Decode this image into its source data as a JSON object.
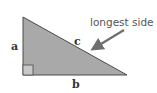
{
  "diagram": {
    "type": "right-triangle",
    "labels": {
      "side_a": "a",
      "side_b": "b",
      "side_c": "c"
    },
    "annotation": "longest side =",
    "colors": {
      "fill": "#a9a9a9",
      "stroke": "#4a4a4a",
      "arrow": "#6e6e6e",
      "right_angle_box": "#c8c8c8"
    }
  }
}
